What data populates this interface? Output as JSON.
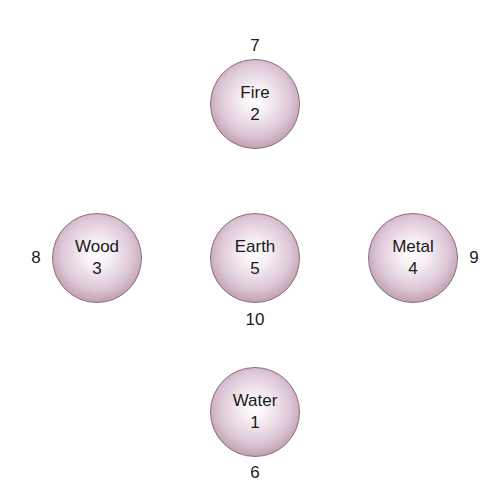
{
  "diagram": {
    "type": "five-elements-numbers",
    "nodes": [
      {
        "id": "fire",
        "name": "Fire",
        "inner_number": "2",
        "outer_number": "7",
        "position": "top"
      },
      {
        "id": "wood",
        "name": "Wood",
        "inner_number": "3",
        "outer_number": "8",
        "position": "left"
      },
      {
        "id": "earth",
        "name": "Earth",
        "inner_number": "5",
        "outer_number": "10",
        "position": "center"
      },
      {
        "id": "metal",
        "name": "Metal",
        "inner_number": "4",
        "outer_number": "9",
        "position": "right"
      },
      {
        "id": "water",
        "name": "Water",
        "inner_number": "1",
        "outer_number": "6",
        "position": "bottom"
      }
    ],
    "colors": {
      "circle_edge": "#9c7688",
      "circle_center": "#ffffff",
      "text": "#1a1a1a",
      "background": "#ffffff"
    }
  }
}
